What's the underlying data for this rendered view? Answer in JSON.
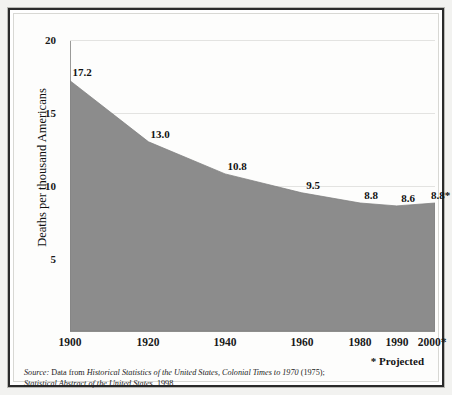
{
  "chart_data": {
    "type": "area",
    "title": "",
    "xlabel": "",
    "ylabel": "Deaths per thousand Americans",
    "categories": [
      "1900",
      "1920",
      "1940",
      "1960",
      "1980",
      "1990",
      "2000*"
    ],
    "x_positions_pct": [
      0,
      21.5,
      42.5,
      63.5,
      79.5,
      89.5,
      100
    ],
    "values": [
      17.2,
      13.0,
      10.8,
      9.5,
      8.8,
      8.6,
      8.8
    ],
    "point_labels": [
      "17.2",
      "13.0",
      "10.8",
      "9.5",
      "8.8",
      "8.6",
      "8.8*"
    ],
    "ylim": [
      0,
      20
    ],
    "yticks": [
      "5",
      "10",
      "15",
      "20"
    ],
    "ytick_values": [
      5,
      10,
      15,
      20
    ],
    "grid": true,
    "gridlines_at": [
      10,
      15,
      20
    ],
    "legend": "none",
    "series_color": "#8c8c8c",
    "grid_color": "#e3e3e1",
    "axis_color": "#8e8e8c"
  },
  "annotations": {
    "projected_note": "* Projected"
  },
  "source": {
    "label": "Source:",
    "line1_plain_a": " Data from ",
    "line1_italic": "Historical Statistics of the United States, Colonial Times to 1970",
    "line1_plain_b": " (1975);",
    "line2_italic": "Statistical Abstract of the United States",
    "line2_plain": ", 1998."
  }
}
